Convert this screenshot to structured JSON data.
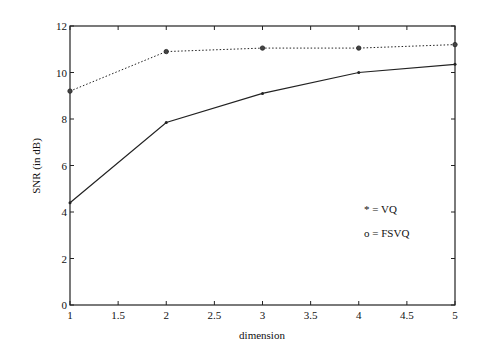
{
  "chart_data": {
    "type": "line",
    "title": "",
    "xlabel": "dimension",
    "ylabel": "SNR (in dB)",
    "xlim": [
      1,
      5
    ],
    "ylim": [
      0,
      12
    ],
    "xticks": [
      "1",
      "1.5",
      "2",
      "2.5",
      "3",
      "3.5",
      "4",
      "4.5",
      "5"
    ],
    "yticks": [
      "0",
      "2",
      "4",
      "6",
      "8",
      "10",
      "12"
    ],
    "grid": false,
    "legend_position": "inside-right",
    "x": [
      1,
      2,
      3,
      4,
      5
    ],
    "series": [
      {
        "name": "VQ",
        "marker": "*",
        "line_style": "solid",
        "values": [
          4.4,
          7.85,
          9.1,
          10.0,
          10.35
        ]
      },
      {
        "name": "FSVQ",
        "marker": "o",
        "line_style": "dotted",
        "values": [
          9.2,
          10.9,
          11.05,
          11.05,
          11.2
        ]
      }
    ],
    "legend": [
      {
        "text": "* = VQ"
      },
      {
        "text": "o = FSVQ"
      }
    ]
  }
}
